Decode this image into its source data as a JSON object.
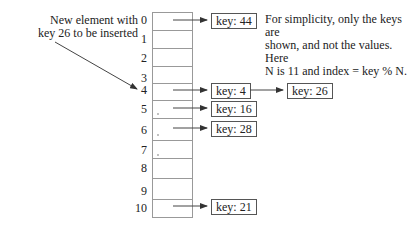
{
  "diagram": {
    "type": "hash-table-separate-chaining",
    "callout": {
      "line1": "New element with",
      "line2": "key 26 to be inserted"
    },
    "note": {
      "line1": "For simplicity, only the keys are",
      "line2": "shown, and not the values. Here",
      "line3": "N is 11 and index = key % N."
    },
    "indices": [
      "0",
      "1",
      "2",
      "3",
      "4",
      "5",
      "6",
      "7",
      "8",
      "9",
      "10"
    ],
    "buckets": [
      {
        "index": 0,
        "chain": [
          "key: 44"
        ]
      },
      {
        "index": 4,
        "chain": [
          "key: 4",
          "key: 26"
        ]
      },
      {
        "index": 5,
        "chain": [
          "key: 16"
        ]
      },
      {
        "index": 6,
        "chain": [
          "key: 28"
        ]
      },
      {
        "index": 10,
        "chain": [
          "key: 21"
        ]
      }
    ],
    "keys": {
      "k44": "key: 44",
      "k4": "key: 4",
      "k26": "key: 26",
      "k16": "key: 16",
      "k28": "key: 28",
      "k21": "key: 21"
    }
  }
}
